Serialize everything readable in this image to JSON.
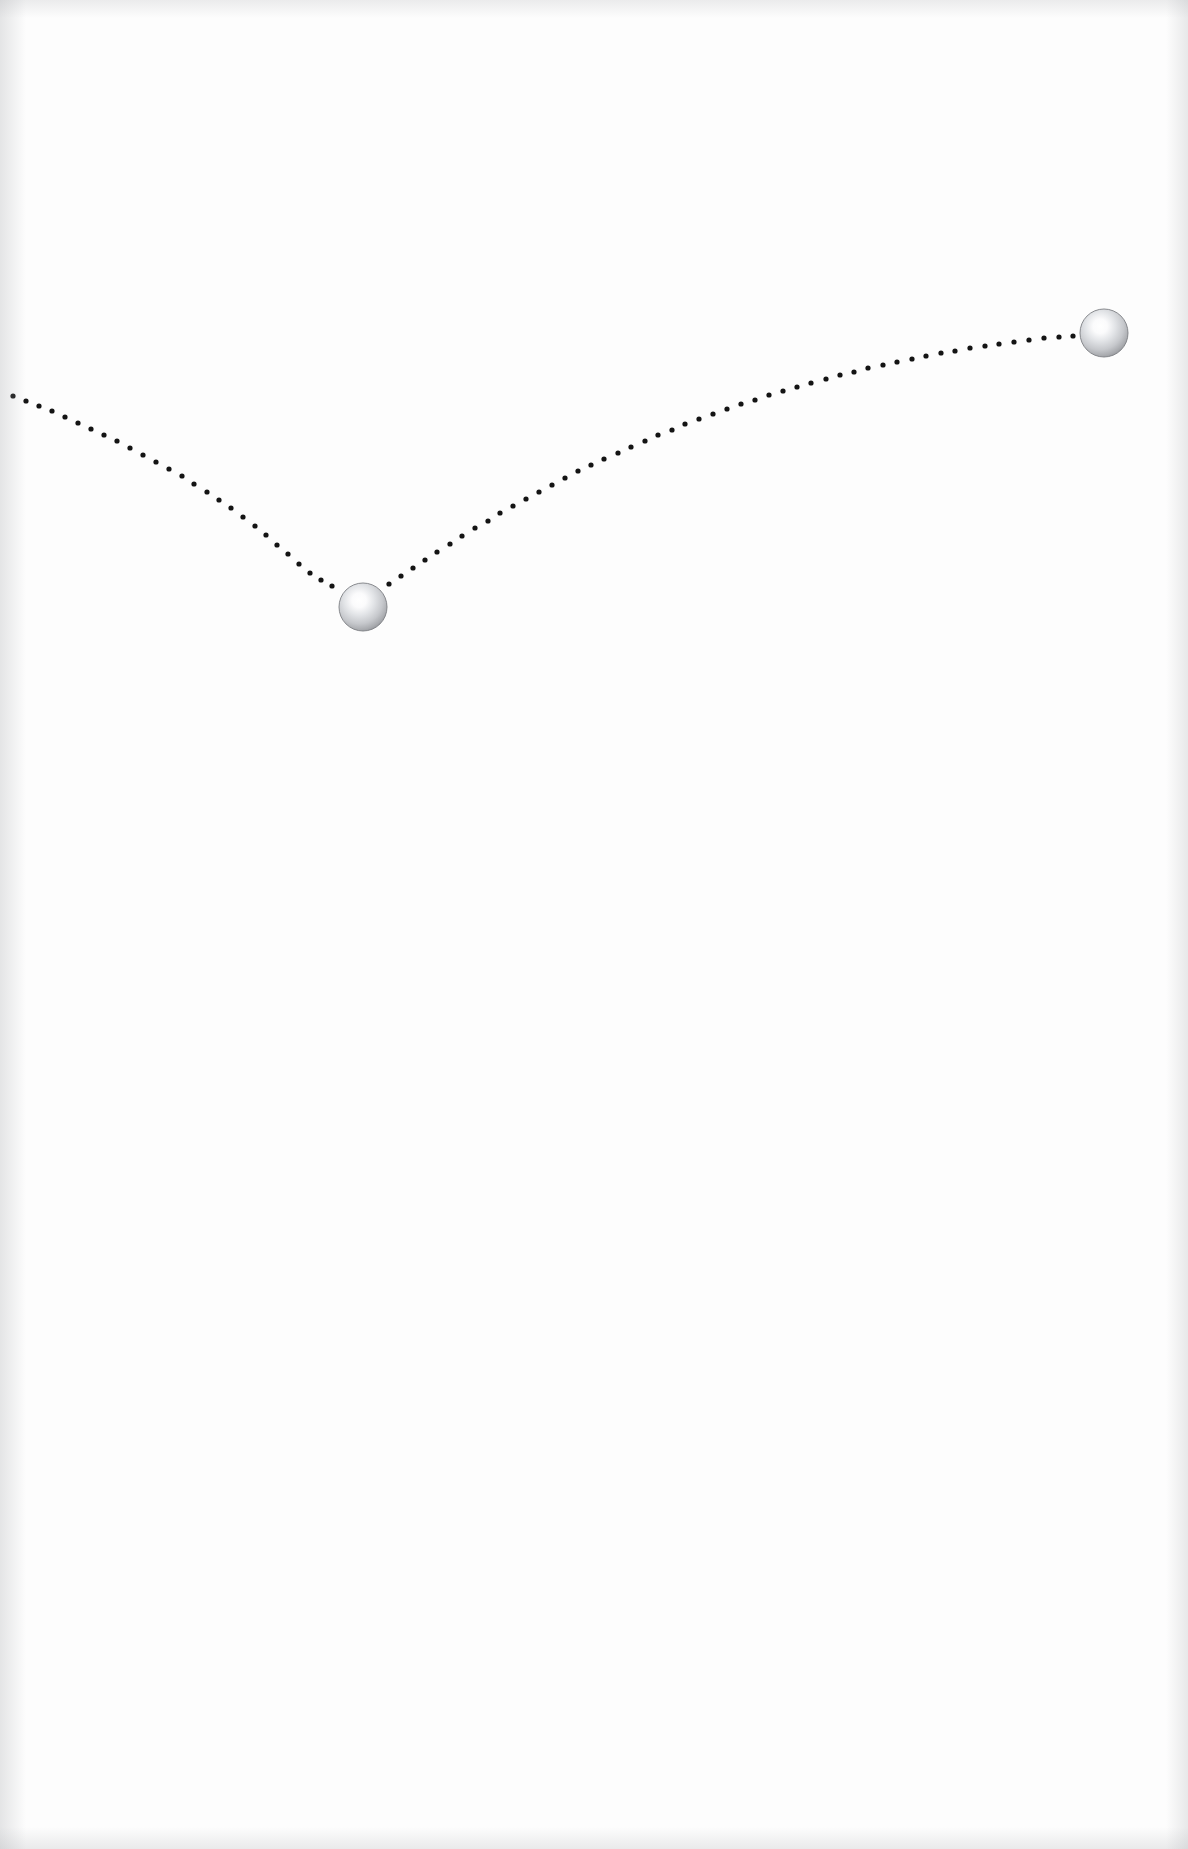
{
  "page": {
    "width": 1188,
    "height": 1849,
    "background_color": "#fdfdfd",
    "paper_edge_tint": "#aaacb0"
  },
  "style": {
    "dot_color": "#141414",
    "dot_radius": 2.6,
    "dot_spacing": 13,
    "sphere_edge_color": "#8e9094",
    "sphere_mid_color": "#c9cbce",
    "sphere_highlight_color": "#ffffff",
    "sphere_outline_color": "#7d7f83"
  },
  "chart_data": {
    "type": "scatter",
    "title": "",
    "subtitle": "",
    "xlabel": "",
    "ylabel": "",
    "xlim": [
      0,
      1188
    ],
    "ylim": [
      0,
      1849
    ],
    "grid": false,
    "legend": false,
    "legend_position": "none",
    "annotations": [],
    "tick_labels": {
      "x": [],
      "y": []
    },
    "series": [
      {
        "name": "incoming-dotted-path",
        "marker": "dot",
        "color": "#141414",
        "points": [
          [
            13,
            396
          ],
          [
            26,
            401
          ],
          [
            39,
            406
          ],
          [
            52,
            411
          ],
          [
            65,
            417
          ],
          [
            78,
            423
          ],
          [
            91,
            429
          ],
          [
            104,
            435
          ],
          [
            117,
            441
          ],
          [
            130,
            448
          ],
          [
            143,
            455
          ],
          [
            156,
            462
          ],
          [
            169,
            469
          ],
          [
            182,
            476
          ],
          [
            194,
            484
          ],
          [
            207,
            492
          ],
          [
            219,
            500
          ],
          [
            231,
            508
          ],
          [
            243,
            517
          ],
          [
            255,
            526
          ],
          [
            266,
            535
          ],
          [
            277,
            545
          ],
          [
            288,
            554
          ],
          [
            299,
            564
          ],
          [
            310,
            573
          ],
          [
            321,
            580
          ],
          [
            332,
            586
          ]
        ]
      },
      {
        "name": "outgoing-dotted-path",
        "marker": "dot",
        "color": "#141414",
        "points": [
          [
            389,
            584
          ],
          [
            401,
            576
          ],
          [
            413,
            568
          ],
          [
            425,
            560
          ],
          [
            437,
            552
          ],
          [
            450,
            544
          ],
          [
            462,
            536
          ],
          [
            475,
            528
          ],
          [
            488,
            521
          ],
          [
            500,
            513
          ],
          [
            513,
            506
          ],
          [
            526,
            499
          ],
          [
            539,
            492
          ],
          [
            552,
            485
          ],
          [
            565,
            478
          ],
          [
            578,
            471
          ],
          [
            591,
            465
          ],
          [
            604,
            459
          ],
          [
            618,
            453
          ],
          [
            631,
            447
          ],
          [
            645,
            441
          ],
          [
            658,
            435
          ],
          [
            672,
            430
          ],
          [
            685,
            424
          ],
          [
            699,
            419
          ],
          [
            713,
            414
          ],
          [
            727,
            409
          ],
          [
            741,
            404
          ],
          [
            755,
            400
          ],
          [
            769,
            395
          ],
          [
            783,
            391
          ],
          [
            797,
            387
          ],
          [
            811,
            383
          ],
          [
            826,
            379
          ],
          [
            840,
            375
          ],
          [
            854,
            372
          ],
          [
            868,
            368
          ],
          [
            883,
            365
          ],
          [
            897,
            362
          ],
          [
            912,
            359
          ],
          [
            926,
            356
          ],
          [
            941,
            353
          ],
          [
            955,
            351
          ],
          [
            970,
            348
          ],
          [
            985,
            346
          ],
          [
            999,
            344
          ],
          [
            1014,
            342
          ],
          [
            1029,
            340
          ],
          [
            1044,
            338
          ],
          [
            1059,
            337
          ],
          [
            1073,
            336
          ]
        ]
      }
    ],
    "spheres": [
      {
        "name": "lower-sphere",
        "cx": 363,
        "cy": 607,
        "r": 24
      },
      {
        "name": "upper-sphere",
        "cx": 1104,
        "cy": 333,
        "r": 24
      }
    ]
  }
}
